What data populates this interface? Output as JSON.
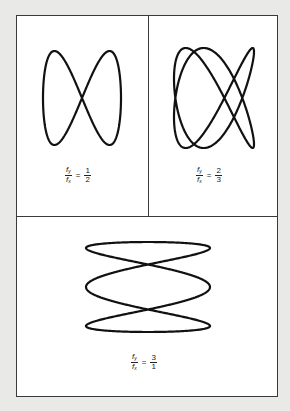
{
  "figure": {
    "stroke_color": "#111111",
    "panels": [
      {
        "id": "ratio-1-2",
        "numerator_var": "f",
        "numerator_sub": "y",
        "denominator_var": "f",
        "denominator_sub": "x",
        "equals": "=",
        "ratio_numerator": "1",
        "ratio_denominator": "2"
      },
      {
        "id": "ratio-2-3",
        "numerator_var": "f",
        "numerator_sub": "y",
        "denominator_var": "f",
        "denominator_sub": "x",
        "equals": "=",
        "ratio_numerator": "2",
        "ratio_denominator": "3"
      },
      {
        "id": "ratio-3-1",
        "numerator_var": "f",
        "numerator_sub": "y",
        "denominator_var": "f",
        "denominator_sub": "x",
        "equals": "=",
        "ratio_numerator": "3",
        "ratio_denominator": "1"
      }
    ]
  }
}
